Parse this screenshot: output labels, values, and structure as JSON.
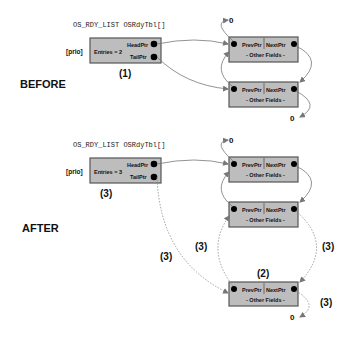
{
  "before": {
    "state_label": "BEFORE",
    "table_title": "OS_RDY_LIST OSRdyTbl[]",
    "index_label": "[prio]",
    "entries_label": "Entries = 2",
    "head_label": "HeadPtr",
    "tail_label": "TailPtr",
    "step_label": "(1)",
    "nodes": [
      {
        "prev_label": "PrevPtr",
        "next_label": "NextPtr",
        "fields_label": "- Other Fields -"
      },
      {
        "prev_label": "PrevPtr",
        "next_label": "NextPtr",
        "fields_label": "- Other Fields -"
      }
    ],
    "null_top": "0",
    "null_bottom": "0"
  },
  "after": {
    "state_label": "AFTER",
    "table_title": "OS_RDY_LIST OSRdyTbl[]",
    "index_label": "[prio]",
    "entries_label": "Entries = 3",
    "head_label": "HeadPtr",
    "tail_label": "TailPtr",
    "step_label": "(3)",
    "new_node_step_label": "(2)",
    "link_step_labels": [
      "(3)",
      "(3)",
      "(3)",
      "(3)"
    ],
    "nodes": [
      {
        "prev_label": "PrevPtr",
        "next_label": "NextPtr",
        "fields_label": "- Other Fields -"
      },
      {
        "prev_label": "PrevPtr",
        "next_label": "NextPtr",
        "fields_label": "- Other Fields -"
      },
      {
        "prev_label": "PrevPtr",
        "next_label": "NextPtr",
        "fields_label": "- Other Fields -"
      }
    ],
    "null_top": "0",
    "null_bottom": "0"
  },
  "colors": {
    "box_fill": "#bdbdbd",
    "box_stroke": "#555555",
    "link_color": "#777777",
    "dot": "#000000"
  }
}
